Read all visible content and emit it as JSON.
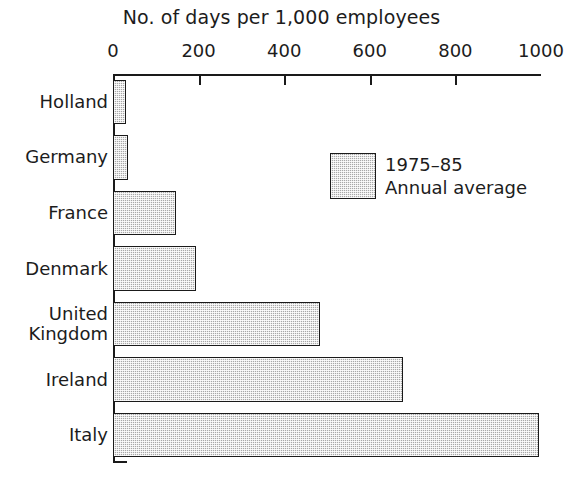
{
  "chart_data": {
    "type": "bar",
    "orientation": "horizontal",
    "title": "No. of days per 1,000 employees",
    "xlabel": "",
    "ylabel": "",
    "categories": [
      "Holland",
      "Germany",
      "France",
      "Denmark",
      "United\nKingdom",
      "Ireland",
      "Italy"
    ],
    "values": [
      30,
      35,
      147,
      193,
      484,
      677,
      995
    ],
    "xlim": [
      0,
      1000
    ],
    "xticks": [
      0,
      200,
      400,
      600,
      800,
      1000
    ],
    "xtick_labels": [
      "0",
      "200",
      "400",
      "600",
      "800",
      "1000"
    ],
    "grid": false,
    "legend": {
      "position": "inside-upper-right",
      "entries": [
        {
          "line1": "1975–85",
          "line2": "Annual average",
          "swatch": "hatched-grey"
        }
      ]
    },
    "series": [
      {
        "name": "1975–85 Annual average",
        "values": [
          30,
          35,
          147,
          193,
          484,
          677,
          995
        ]
      }
    ]
  },
  "colors": {
    "bar_fill": "#a8a8a8",
    "bar_stroke": "#1a1a1a",
    "axis": "#1a1a1a",
    "text": "#1c1c1c",
    "background": "#ffffff"
  },
  "icons": {}
}
